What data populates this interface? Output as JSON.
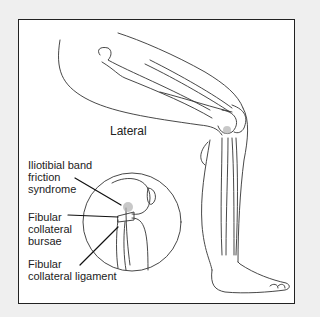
{
  "figure": {
    "view_label": "Lateral",
    "labels": [
      {
        "id": "itb",
        "text": "Iliotibial band\nfriction\nsyndrome"
      },
      {
        "id": "bursae",
        "text": "Fibular\ncollateral\nbursae"
      },
      {
        "id": "ligament",
        "text": "Fibular\ncollateral ligament"
      }
    ],
    "colors": {
      "background": "#efefef",
      "panel": "#ffffff",
      "line": "#222222",
      "highlight": "#b0b0b0"
    }
  }
}
